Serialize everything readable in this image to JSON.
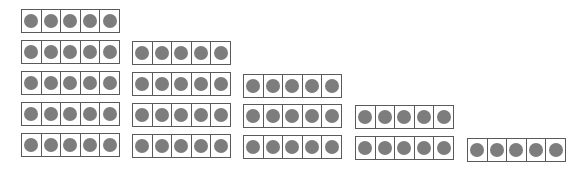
{
  "diagram": {
    "colors": {
      "dot": "#7d7d7d",
      "border": "#5a5a5a",
      "background": "#ffffff"
    },
    "cells_per_frame": 5,
    "columns": [
      {
        "label": "column-1",
        "frame_count": 5,
        "x": 21,
        "frames": [
          {
            "y": 9,
            "filled": 5
          },
          {
            "y": 40,
            "filled": 5
          },
          {
            "y": 71,
            "filled": 5
          },
          {
            "y": 102,
            "filled": 5
          },
          {
            "y": 133,
            "filled": 5
          }
        ]
      },
      {
        "label": "column-2",
        "frame_count": 4,
        "x": 132,
        "frames": [
          {
            "y": 41,
            "filled": 5
          },
          {
            "y": 72,
            "filled": 5
          },
          {
            "y": 103,
            "filled": 5
          },
          {
            "y": 134,
            "filled": 5
          }
        ]
      },
      {
        "label": "column-3",
        "frame_count": 3,
        "x": 243,
        "frames": [
          {
            "y": 74,
            "filled": 5
          },
          {
            "y": 104,
            "filled": 5
          },
          {
            "y": 135,
            "filled": 5
          }
        ]
      },
      {
        "label": "column-4",
        "frame_count": 2,
        "x": 355,
        "frames": [
          {
            "y": 105,
            "filled": 5
          },
          {
            "y": 136,
            "filled": 5
          }
        ]
      },
      {
        "label": "column-5",
        "frame_count": 1,
        "x": 467,
        "frames": [
          {
            "y": 138,
            "filled": 5
          }
        ]
      }
    ]
  }
}
